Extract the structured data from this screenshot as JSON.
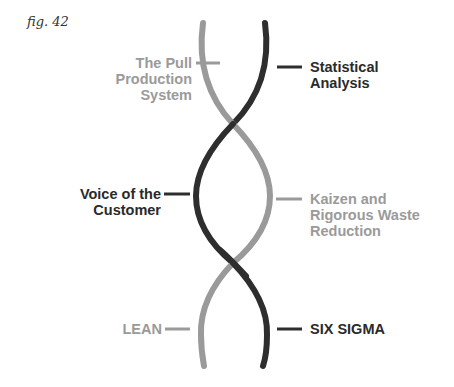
{
  "figure": {
    "label": "fig. 42"
  },
  "colors": {
    "lean_strand": "#9a9a9a",
    "six_sigma_strand": "#2e2e2e",
    "background": "#ffffff"
  },
  "strands": [
    {
      "name": "LEAN",
      "color": "#9a9a9a"
    },
    {
      "name": "SIX SIGMA",
      "color": "#2e2e2e"
    }
  ],
  "labels": {
    "left": [
      {
        "lines": [
          "The Pull",
          "Production",
          "System"
        ],
        "tone": "gray"
      },
      {
        "lines": [
          "Voice of the",
          "Customer"
        ],
        "tone": "dark"
      },
      {
        "lines": [
          "LEAN"
        ],
        "tone": "gray"
      }
    ],
    "right": [
      {
        "lines": [
          "Statistical",
          "Analysis"
        ],
        "tone": "dark"
      },
      {
        "lines": [
          "Kaizen and",
          "Rigorous Waste",
          "Reduction"
        ],
        "tone": "gray"
      },
      {
        "lines": [
          "SIX SIGMA"
        ],
        "tone": "dark"
      }
    ]
  }
}
